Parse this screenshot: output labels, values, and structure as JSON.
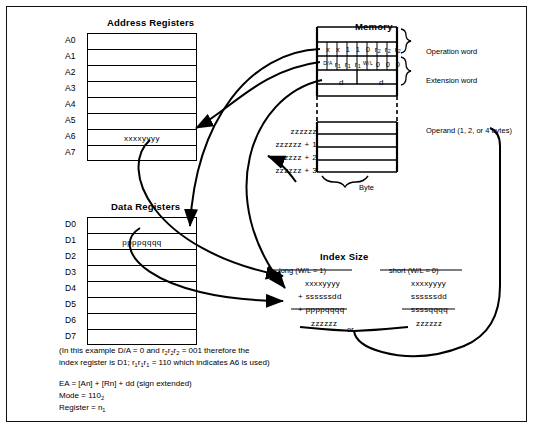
{
  "diagram": {
    "address_registers": {
      "title": "Address Registers",
      "labels": [
        "A0",
        "A1",
        "A2",
        "A3",
        "A4",
        "A5",
        "A6",
        "A7"
      ],
      "values": [
        "",
        "",
        "",
        "",
        "",
        "",
        "xxxxyyyy",
        ""
      ]
    },
    "data_registers": {
      "title": "Data Registers",
      "labels": [
        "D0",
        "D1",
        "D2",
        "D3",
        "D4",
        "D5",
        "D6",
        "D7"
      ],
      "values": [
        "",
        "ppppqqqq",
        "",
        "",
        "",
        "",
        "",
        ""
      ]
    },
    "memory": {
      "title": "Memory",
      "operation_word_label": "Operation word",
      "extension_word_label": "Extension word",
      "operand_label": "Operand (1, 2, or 4 bytes)",
      "byte_label": "Byte",
      "operation_word_bits": [
        "x",
        "x",
        "1",
        "1",
        "0",
        "r₂",
        "r₂",
        "r₂"
      ],
      "extension_word_bits": [
        "D/A",
        "r₁",
        "r₁",
        "r₁",
        "W/L",
        "0",
        "0",
        "0"
      ],
      "displacement_cells": [
        "d",
        "d"
      ],
      "addresses": [
        "zzzzzz",
        "zzzzzz + 1",
        "zzzzzz + 2",
        "zzzzzz + 3"
      ]
    },
    "index_size": {
      "title": "Index Size",
      "long_header": "long (W/L = 1)",
      "short_header": "short (W/L = 0)",
      "or_label": "or",
      "long_terms": [
        "xxxxyyyy",
        "+ ssssssdd",
        "+ ppppqqqq"
      ],
      "long_result": "zzzzzz",
      "short_terms": [
        "xxxxyyyy",
        "ssssssdd",
        "ssssqqqq"
      ],
      "short_result": "zzzzzz"
    },
    "notes": {
      "line1": "(In this example D/A = 0 and r₂r₂r₂ = 001 therefore the",
      "line2": "index register is D1; r₁r₁r₁ = 110 which indicates A6 is used)",
      "ea": "EA = [An] + [Rn] + dd (sign extended)",
      "mode": "Mode = 110₂",
      "register": "Register = n₁"
    }
  }
}
